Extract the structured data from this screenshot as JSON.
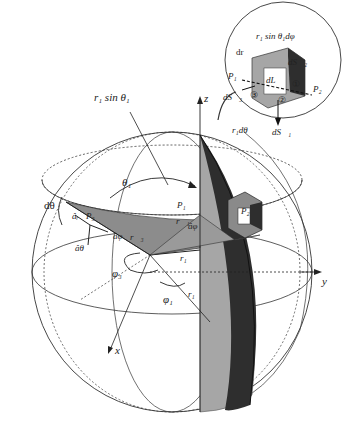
{
  "diagram": {
    "type": "spherical-coordinates-volume-element",
    "axes": {
      "x": "x",
      "y": "y",
      "z": "z"
    },
    "colors": {
      "light_gray": "#a6a6a6",
      "mid_gray": "#8c8c8c",
      "dark": "#2e2e2e",
      "line": "#333333"
    },
    "main_labels": {
      "r_sin_theta": "r₁ sin θ₁",
      "d_theta": "dθ",
      "theta1": "θ₁",
      "a_r": "âᵣ",
      "a_theta": "âθ",
      "a_phi_left": "âφ",
      "a_phi_right": "âφ",
      "p1": "P₁",
      "p2": "P₂",
      "p3": "P₃",
      "r1_vec": "r⃗₁",
      "r3_vec": "r⃗₃",
      "r1_a": "r₁",
      "r1_b": "r₁",
      "phi3": "φ₃",
      "phi1": "φ₁"
    },
    "inset": {
      "top_label": "r₁ sin θ₁dφ",
      "dr": "dr",
      "p1": "P₁",
      "p2": "P₂",
      "dL": "dL⃗",
      "dS2": "dS⃗₂",
      "dS3": "dS⃗₃",
      "dS1": "dS⃗₁",
      "r_dtheta": "r₁dθ",
      "face1": "①",
      "face2": "②",
      "face3": "③"
    }
  }
}
